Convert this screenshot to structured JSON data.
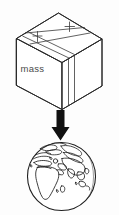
{
  "figure": {
    "background_color": "#fdfdfd",
    "line_color": "#2b2b2b",
    "arrow_color": "#111111",
    "width": 119,
    "height": 215
  },
  "box": {
    "label": "mass",
    "label_color": "#4a4a4a",
    "name": "cardboard-box",
    "description": "isometric cardboard box with packing tape",
    "fill_color": "#ffffff"
  },
  "arrow": {
    "direction": "down",
    "name": "gravity-arrow",
    "color": "#111111"
  },
  "globe": {
    "name": "earth-globe",
    "description": "globe showing Africa, Europe and Asia",
    "outline_color": "#1f1f1f",
    "fill_color": "#ffffff"
  }
}
